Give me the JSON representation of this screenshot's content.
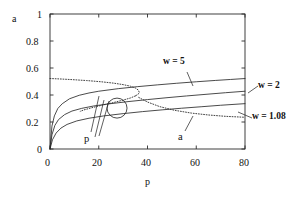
{
  "chart_data": {
    "type": "line",
    "title": "",
    "xlabel": "p",
    "ylabel": "a",
    "xlim": [
      0,
      80
    ],
    "ylim": [
      0,
      1
    ],
    "xticks": [
      0,
      20,
      40,
      60,
      80
    ],
    "yticks": [
      0,
      0.2,
      0.4,
      0.6,
      0.8,
      1
    ],
    "xtick_labels": [
      "0",
      "20",
      "40",
      "60",
      "80"
    ],
    "ytick_labels": [
      "0",
      "0.2",
      "0.4",
      "0.6",
      "0.8",
      "1"
    ],
    "grid": false,
    "legend_position": "inline-annotations",
    "series": [
      {
        "name": "w = 5",
        "style": "solid",
        "label": "w = 5",
        "points": [
          [
            0,
            0
          ],
          [
            0.8,
            0.17
          ],
          [
            1.8,
            0.245
          ],
          [
            3.2,
            0.3
          ],
          [
            5,
            0.335
          ],
          [
            8,
            0.372
          ],
          [
            12,
            0.398
          ],
          [
            16,
            0.415
          ],
          [
            20,
            0.428
          ],
          [
            28,
            0.447
          ],
          [
            36,
            0.462
          ],
          [
            44,
            0.475
          ],
          [
            52,
            0.487
          ],
          [
            60,
            0.498
          ],
          [
            68,
            0.508
          ],
          [
            74,
            0.515
          ],
          [
            80,
            0.522
          ]
        ]
      },
      {
        "name": "w = 2",
        "style": "solid",
        "label": "w = 2",
        "points": [
          [
            0,
            0
          ],
          [
            0.8,
            0.105
          ],
          [
            2,
            0.175
          ],
          [
            3.5,
            0.218
          ],
          [
            6,
            0.255
          ],
          [
            9,
            0.281
          ],
          [
            13,
            0.301
          ],
          [
            18,
            0.319
          ],
          [
            24,
            0.334
          ],
          [
            32,
            0.351
          ],
          [
            40,
            0.366
          ],
          [
            48,
            0.38
          ],
          [
            56,
            0.393
          ],
          [
            64,
            0.405
          ],
          [
            72,
            0.417
          ],
          [
            80,
            0.428
          ]
        ]
      },
      {
        "name": "w = 1.08",
        "style": "solid",
        "label": "w = 1.08",
        "points": [
          [
            0,
            0
          ],
          [
            1,
            0.068
          ],
          [
            2.5,
            0.118
          ],
          [
            4.5,
            0.155
          ],
          [
            7,
            0.182
          ],
          [
            11,
            0.208
          ],
          [
            16,
            0.228
          ],
          [
            22,
            0.245
          ],
          [
            30,
            0.262
          ],
          [
            38,
            0.277
          ],
          [
            46,
            0.29
          ],
          [
            54,
            0.302
          ],
          [
            62,
            0.313
          ],
          [
            70,
            0.324
          ],
          [
            80,
            0.336
          ]
        ]
      },
      {
        "name": "a",
        "style": "dotted",
        "label": "a",
        "upper_branch": [
          [
            0,
            0.522
          ],
          [
            4,
            0.519
          ],
          [
            9,
            0.514
          ],
          [
            15,
            0.507
          ],
          [
            21,
            0.498
          ],
          [
            26,
            0.488
          ],
          [
            30,
            0.477
          ],
          [
            33,
            0.465
          ],
          [
            35,
            0.452
          ],
          [
            36.2,
            0.437
          ],
          [
            36.6,
            0.421
          ],
          [
            36.2,
            0.406
          ],
          [
            35,
            0.393
          ]
        ],
        "lower_branch": [
          [
            35,
            0.393
          ],
          [
            33,
            0.378
          ],
          [
            30,
            0.362
          ],
          [
            26,
            0.344
          ],
          [
            21,
            0.323
          ],
          [
            17,
            0.305
          ],
          [
            14,
            0.29
          ],
          [
            12.4,
            0.279
          ]
        ],
        "tail_branch": [
          [
            36.4,
            0.382
          ],
          [
            40,
            0.348
          ],
          [
            45,
            0.314
          ],
          [
            51,
            0.287
          ],
          [
            58,
            0.266
          ],
          [
            65,
            0.252
          ],
          [
            72,
            0.242
          ],
          [
            80,
            0.235
          ]
        ]
      }
    ],
    "annotations": [
      {
        "name": "intersection-marker",
        "kind": "circle",
        "x": 27.5,
        "y": 0.303,
        "radius_px": 10
      },
      {
        "name": "p-annotation",
        "kind": "text",
        "text": "p",
        "x": 13.5,
        "y": 0.105
      },
      {
        "name": "a-annotation",
        "kind": "text",
        "text": "a",
        "x": 52.5,
        "y": 0.115
      },
      {
        "name": "w5-annotation",
        "kind": "text",
        "text": "w = 5",
        "x": 48,
        "y": 0.7
      },
      {
        "name": "w2-annotation",
        "kind": "text",
        "text": "w = 2",
        "x": 86,
        "y": 0.565
      },
      {
        "name": "w108-annotation",
        "kind": "text",
        "text": "w = 1.08",
        "x": 86,
        "y": 0.4
      }
    ]
  },
  "axes": {
    "x_axis_label": "p",
    "y_axis_label": "a"
  },
  "labels": {
    "w5": "w = 5",
    "w2": "w = 2",
    "w108": "w = 1.08",
    "p_marker": "p",
    "a_marker": "a"
  }
}
